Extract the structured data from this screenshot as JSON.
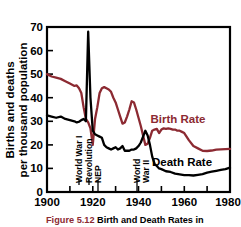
{
  "chart_data": {
    "type": "line",
    "title": "",
    "xlabel": "",
    "ylabel": "Births and deaths per thousand population",
    "ylabel_line1": "Births and deaths",
    "ylabel_line2": "per thousand population",
    "xlim": [
      1900,
      1980
    ],
    "ylim": [
      0,
      70
    ],
    "grid": false,
    "legend_position": "inline-right",
    "x_ticks_labeled": [
      "1900",
      "1920",
      "1940",
      "1960",
      "1980"
    ],
    "x_ticks_labeled_values": [
      1900,
      1920,
      1940,
      1960,
      1980
    ],
    "x_ticks_minor_values": [
      1910,
      1930,
      1950,
      1970
    ],
    "y_ticks": [
      "0",
      "10",
      "20",
      "30",
      "40",
      "50",
      "60",
      "70"
    ],
    "y_tick_values": [
      0,
      10,
      20,
      30,
      40,
      50,
      60,
      70
    ],
    "annotations": [
      {
        "label": "World War I",
        "x": 1914,
        "orientation": "vertical"
      },
      {
        "label": "Revolution",
        "x": 1917,
        "orientation": "vertical"
      },
      {
        "label": "NEP",
        "x": 1921,
        "orientation": "vertical"
      },
      {
        "label": "World War II",
        "label_line1": "World",
        "label_line2": "War II",
        "x": 1941,
        "orientation": "vertical"
      }
    ],
    "series": [
      {
        "name": "Birth Rate",
        "color": "#8C2A32",
        "label_x": 1962,
        "label_y": 31,
        "x": [
          1900,
          1902,
          1904,
          1906,
          1908,
          1910,
          1911,
          1912,
          1913,
          1914,
          1915,
          1916,
          1917,
          1918,
          1919,
          1920,
          1921,
          1922,
          1923,
          1924,
          1925,
          1926,
          1927,
          1928,
          1929,
          1930,
          1931,
          1932,
          1933,
          1934,
          1935,
          1936,
          1937,
          1938,
          1939,
          1940,
          1941,
          1942,
          1943,
          1944,
          1945,
          1946,
          1947,
          1948,
          1949,
          1950,
          1951,
          1952,
          1953,
          1954,
          1955,
          1956,
          1957,
          1958,
          1959,
          1960,
          1962,
          1964,
          1966,
          1968,
          1970,
          1972,
          1974,
          1976,
          1978,
          1980
        ],
        "y": [
          50.0,
          49.0,
          48.5,
          48.0,
          47.0,
          46.0,
          45.5,
          45.0,
          45.2,
          44.0,
          42.0,
          36.0,
          31.0,
          29.5,
          27.0,
          20.0,
          31.0,
          36.0,
          42.0,
          44.0,
          44.5,
          44.0,
          43.5,
          42.5,
          40.0,
          38.0,
          35.0,
          32.0,
          29.0,
          29.5,
          32.0,
          35.0,
          38.5,
          38.0,
          35.0,
          31.5,
          28.0,
          24.0,
          20.0,
          20.5,
          23.0,
          26.0,
          26.5,
          26.8,
          25.0,
          26.5,
          27.0,
          26.8,
          27.0,
          26.8,
          26.5,
          26.5,
          26.0,
          26.0,
          25.5,
          25.0,
          22.0,
          19.5,
          18.5,
          17.5,
          17.4,
          17.6,
          18.0,
          18.1,
          18.2,
          18.3
        ]
      },
      {
        "name": "Death Rate",
        "color": "#000000",
        "label_x": 1949,
        "label_y": 12,
        "x": [
          1900,
          1902,
          1904,
          1906,
          1908,
          1910,
          1912,
          1913,
          1914,
          1915,
          1916,
          1917,
          1918,
          1919,
          1920,
          1921,
          1922,
          1923,
          1924,
          1925,
          1926,
          1927,
          1928,
          1929,
          1930,
          1931,
          1932,
          1933,
          1934,
          1935,
          1936,
          1937,
          1938,
          1939,
          1940,
          1941,
          1942,
          1943,
          1944,
          1945,
          1946,
          1947,
          1948,
          1949,
          1950,
          1952,
          1954,
          1956,
          1958,
          1960,
          1962,
          1964,
          1966,
          1968,
          1970,
          1972,
          1974,
          1976,
          1978,
          1980
        ],
        "y": [
          32.5,
          32.0,
          31.5,
          32.0,
          31.0,
          30.5,
          30.0,
          29.5,
          29.8,
          30.5,
          31.0,
          30.0,
          68.0,
          40.0,
          26.0,
          24.5,
          24.0,
          23.5,
          23.0,
          20.0,
          19.0,
          18.5,
          18.0,
          18.5,
          19.0,
          18.0,
          18.5,
          19.5,
          17.5,
          17.5,
          17.5,
          18.0,
          18.0,
          18.5,
          19.5,
          21.0,
          23.5,
          26.0,
          24.0,
          20.0,
          15.0,
          12.0,
          11.0,
          10.0,
          9.7,
          8.8,
          8.5,
          7.8,
          7.5,
          7.2,
          7.2,
          7.0,
          7.3,
          7.6,
          8.2,
          8.6,
          9.0,
          9.4,
          9.7,
          10.3
        ]
      }
    ]
  },
  "caption": {
    "figure_number": "Figure 5.12",
    "text": "Birth and Death Rates in"
  }
}
